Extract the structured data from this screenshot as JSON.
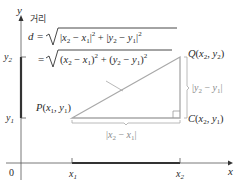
{
  "diagram": {
    "type": "distance-formula-coordinate-diagram",
    "axes": {
      "x_label": "x",
      "y_label": "y",
      "origin_label": "0",
      "x_ticks": [
        "x1",
        "x2"
      ],
      "y_ticks": [
        "y1",
        "y2"
      ]
    },
    "annotation_label": "거리",
    "formula": {
      "line1_lhs": "d =",
      "line1_rhs": "|x₂ − x₁|² + |y₂ − y₁|²",
      "line2_lhs": "=",
      "line2_rhs": "(x₂ − x₁)² + (y₂ − y₁)²"
    },
    "points": {
      "P": "P(x₁, y₁)",
      "Q": "Q(x₂, y₂)",
      "C": "C(x₂, y₁)"
    },
    "side_labels": {
      "horizontal": "|x₂ − x₁|",
      "vertical": "|y₂ − y₁|"
    },
    "colors": {
      "axis": "#333333",
      "triangle": "#a8a8a8",
      "bracket": "#a8a8a8",
      "text": "#2a2a2a",
      "muted_text": "#8a8a8a"
    }
  }
}
